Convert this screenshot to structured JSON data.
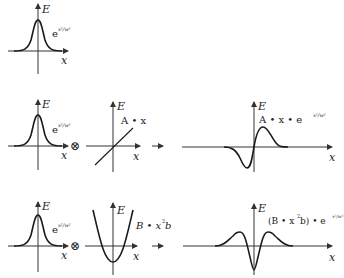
{
  "diagram": {
    "axis_labels": {
      "y": "E",
      "x": "x"
    },
    "operators": {
      "product": "⊗"
    },
    "rows": [
      {
        "panels": [
          {
            "kind": "gaussian",
            "label_base": "e",
            "label_exp": "x²/w²"
          }
        ]
      },
      {
        "panels": [
          {
            "kind": "gaussian",
            "label_base": "e",
            "label_exp": "x²/w²"
          },
          {
            "kind": "linear",
            "label": "A • x"
          },
          {
            "kind": "result",
            "label_prefix": "A • x • e",
            "label_exp": "x²/w²"
          }
        ]
      },
      {
        "panels": [
          {
            "kind": "gaussian",
            "label_base": "e",
            "label_exp": "x²/w²"
          },
          {
            "kind": "parabola",
            "label_main": "B • x",
            "label_sup": "2",
            "label_tail": "b"
          },
          {
            "kind": "result",
            "label_prefix": "(B • x",
            "label_sup": "2",
            "label_mid": "b) • e",
            "label_exp": "x²/w²"
          }
        ]
      }
    ],
    "colors": {
      "stroke": "#1a1a1a",
      "axis": "#333333",
      "background": "#ffffff"
    }
  }
}
